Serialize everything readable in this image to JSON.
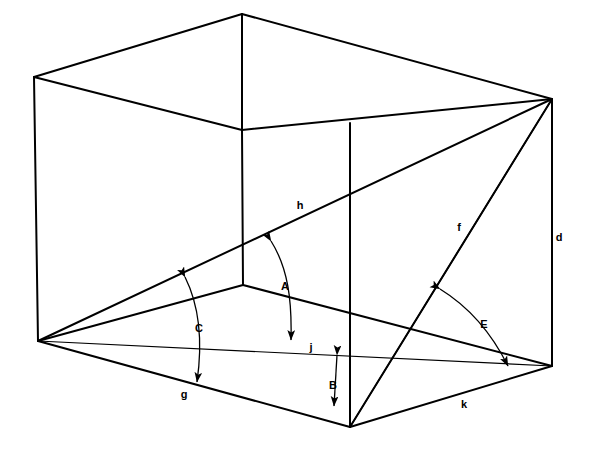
{
  "figure": {
    "background_color": "#ffffff",
    "line_color": "#000000",
    "label_color": "#000000",
    "canvas": {
      "width": 591,
      "height": 452
    }
  },
  "vertices": {
    "top_back_left": {
      "x": 34,
      "y": 77
    },
    "top_apex": {
      "x": 242,
      "y": 14
    },
    "top_back_right": {
      "x": 552,
      "y": 99
    },
    "top_inner": {
      "x": 242,
      "y": 130
    },
    "floor_inner": {
      "x": 243,
      "y": 285
    },
    "floor_left": {
      "x": 38,
      "y": 341
    },
    "floor_front": {
      "x": 350,
      "y": 427
    },
    "floor_right": {
      "x": 552,
      "y": 366
    }
  },
  "edges": [
    {
      "name": "top-left-ridge",
      "from": "top_back_left",
      "to": "top_apex",
      "weight": 2
    },
    {
      "name": "top-right-ridge",
      "from": "top_apex",
      "to": "top_back_right",
      "weight": 2
    },
    {
      "name": "ceiling-left-fold",
      "from": "top_back_left",
      "to": "top_inner",
      "weight": 2
    },
    {
      "name": "ceiling-right-fold",
      "from": "top_inner",
      "to": "top_back_right",
      "weight": 2
    },
    {
      "name": "apex-vertical",
      "from": "top_apex",
      "to": "top_inner",
      "weight": 2
    },
    {
      "name": "inner-vertical-post",
      "from": "top_inner",
      "to": "floor_inner",
      "weight": 2
    },
    {
      "name": "left-wall-vertical",
      "from": "top_back_left",
      "to": "floor_left",
      "weight": 2
    },
    {
      "name": "right-wall-vertical-d",
      "from": "top_back_right",
      "to": "floor_right",
      "weight": 2
    },
    {
      "name": "floor-left-fold",
      "from": "floor_left",
      "to": "floor_inner",
      "weight": 2
    },
    {
      "name": "floor-right-fold",
      "from": "floor_inner",
      "to": "floor_right",
      "weight": 2
    },
    {
      "name": "floor-front-left-g",
      "from": "floor_left",
      "to": "floor_front",
      "weight": 2
    },
    {
      "name": "floor-front-right-k",
      "from": "floor_front",
      "to": "floor_right",
      "weight": 2
    },
    {
      "name": "front-vertical",
      "from": "floor_front",
      "to": "top_back_right",
      "weight": 2
    }
  ],
  "diagonals": [
    {
      "name": "diagonal-h",
      "label": "h",
      "from": "floor_left",
      "to": "top_back_right",
      "weight": 2
    },
    {
      "name": "diagonal-f",
      "label": "f",
      "from": "top_back_right",
      "to": "floor_front",
      "weight": 1.4
    },
    {
      "name": "baseline-j",
      "label": "j",
      "from": "floor_left",
      "to": "floor_right",
      "weight": 1.2
    }
  ],
  "front_post": {
    "name": "front-vertical-post",
    "from": {
      "x": 350,
      "y": 427
    },
    "to": {
      "x": 350,
      "y": 123
    },
    "weight": 2
  },
  "edge_labels": [
    {
      "id": "h",
      "text": "h",
      "x": 300,
      "y": 209,
      "describes": "long body diagonal, floor-left to top-back-right"
    },
    {
      "id": "f",
      "text": "f",
      "x": 459,
      "y": 231,
      "describes": "diagonal from top-back-right to floor-front"
    },
    {
      "id": "d",
      "text": "d",
      "x": 559,
      "y": 241,
      "describes": "right vertical height edge"
    },
    {
      "id": "j",
      "text": "j",
      "x": 311,
      "y": 351,
      "describes": "baseline from floor-left to floor-right"
    },
    {
      "id": "g",
      "text": "g",
      "x": 184,
      "y": 398,
      "describes": "front-left floor edge"
    },
    {
      "id": "k",
      "text": "k",
      "x": 464,
      "y": 408,
      "describes": "front-right floor edge"
    }
  ],
  "angle_markers": [
    {
      "id": "A",
      "text": "A",
      "label_x": 285,
      "label_y": 290,
      "type": "double-headed-curved-arrow",
      "describes": "angle between diagonal h and baseline j",
      "path": "M 271 241 C 288 268, 292 300, 291 340",
      "arrow_start": {
        "x": 271,
        "y": 241,
        "angle": -120
      },
      "arrow_end": {
        "x": 291,
        "y": 344,
        "angle": 88
      }
    },
    {
      "id": "B",
      "text": "B",
      "label_x": 333,
      "label_y": 389,
      "type": "double-headed-straight-arrow",
      "describes": "vertical gap between baseline j and front floor edge",
      "path": "M 337 355 L 334 406",
      "arrow_start": {
        "x": 337,
        "y": 353,
        "angle": -92
      },
      "arrow_end": {
        "x": 334,
        "y": 409,
        "angle": 88
      }
    },
    {
      "id": "C",
      "text": "C",
      "label_x": 199,
      "label_y": 332,
      "type": "double-headed-curved-arrow",
      "describes": "angle between diagonal h and front-left floor edge g",
      "path": "M 185 277 C 199 305, 203 340, 197 382",
      "arrow_start": {
        "x": 184,
        "y": 274,
        "angle": -118
      },
      "arrow_end": {
        "x": 197,
        "y": 385,
        "angle": 95
      }
    },
    {
      "id": "E",
      "text": "E",
      "label_x": 484,
      "label_y": 328,
      "type": "double-headed-curved-arrow",
      "describes": "angle between diagonal f and front-right floor edge k",
      "path": "M 440 289 C 466 305, 490 330, 508 366",
      "arrow_start": {
        "x": 437,
        "y": 287,
        "angle": -150
      },
      "arrow_end": {
        "x": 510,
        "y": 369,
        "angle": 62
      }
    }
  ]
}
